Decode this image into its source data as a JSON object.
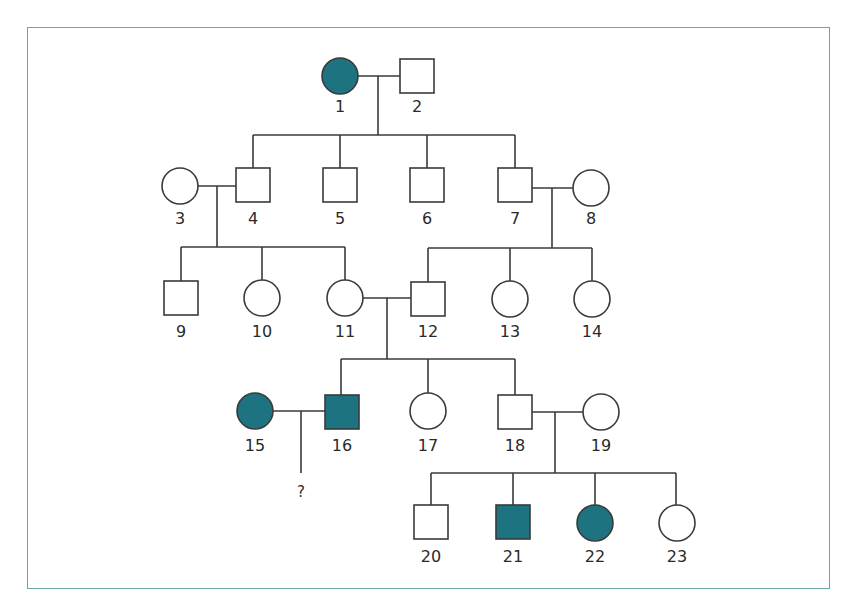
{
  "diagram": {
    "type": "pedigree",
    "colors": {
      "affected_fill": "#1d7380",
      "stroke": "#3a3a3a",
      "unaffected_fill": "#ffffff",
      "frame": "#6aa6ae"
    },
    "individuals": [
      {
        "id": "1",
        "label": "1",
        "sex": "female",
        "affected": true,
        "generation": 1
      },
      {
        "id": "2",
        "label": "2",
        "sex": "male",
        "affected": false,
        "generation": 1
      },
      {
        "id": "3",
        "label": "3",
        "sex": "female",
        "affected": false,
        "generation": 2
      },
      {
        "id": "4",
        "label": "4",
        "sex": "male",
        "affected": false,
        "generation": 2
      },
      {
        "id": "5",
        "label": "5",
        "sex": "male",
        "affected": false,
        "generation": 2
      },
      {
        "id": "6",
        "label": "6",
        "sex": "male",
        "affected": false,
        "generation": 2
      },
      {
        "id": "7",
        "label": "7",
        "sex": "male",
        "affected": false,
        "generation": 2
      },
      {
        "id": "8",
        "label": "8",
        "sex": "female",
        "affected": false,
        "generation": 2
      },
      {
        "id": "9",
        "label": "9",
        "sex": "male",
        "affected": false,
        "generation": 3
      },
      {
        "id": "10",
        "label": "10",
        "sex": "female",
        "affected": false,
        "generation": 3
      },
      {
        "id": "11",
        "label": "11",
        "sex": "female",
        "affected": false,
        "generation": 3
      },
      {
        "id": "12",
        "label": "12",
        "sex": "male",
        "affected": false,
        "generation": 3
      },
      {
        "id": "13",
        "label": "13",
        "sex": "female",
        "affected": false,
        "generation": 3
      },
      {
        "id": "14",
        "label": "14",
        "sex": "female",
        "affected": false,
        "generation": 3
      },
      {
        "id": "15",
        "label": "15",
        "sex": "female",
        "affected": true,
        "generation": 4
      },
      {
        "id": "16",
        "label": "16",
        "sex": "male",
        "affected": true,
        "generation": 4
      },
      {
        "id": "17",
        "label": "17",
        "sex": "female",
        "affected": false,
        "generation": 4
      },
      {
        "id": "18",
        "label": "18",
        "sex": "male",
        "affected": false,
        "generation": 4
      },
      {
        "id": "19",
        "label": "19",
        "sex": "female",
        "affected": false,
        "generation": 4
      },
      {
        "id": "20",
        "label": "20",
        "sex": "male",
        "affected": false,
        "generation": 5
      },
      {
        "id": "21",
        "label": "21",
        "sex": "male",
        "affected": true,
        "generation": 5
      },
      {
        "id": "22",
        "label": "22",
        "sex": "female",
        "affected": true,
        "generation": 5
      },
      {
        "id": "23",
        "label": "23",
        "sex": "female",
        "affected": false,
        "generation": 5
      }
    ],
    "unknown_offspring_label": "?",
    "matings": [
      {
        "parents": [
          "1",
          "2"
        ],
        "children": [
          "4",
          "5",
          "6",
          "7"
        ]
      },
      {
        "parents": [
          "3",
          "4"
        ],
        "children": [
          "9",
          "10",
          "11"
        ]
      },
      {
        "parents": [
          "7",
          "8"
        ],
        "children": [
          "12",
          "13",
          "14"
        ]
      },
      {
        "parents": [
          "11",
          "12"
        ],
        "children": [
          "16",
          "17",
          "18"
        ]
      },
      {
        "parents": [
          "15",
          "16"
        ],
        "children": [
          "?"
        ]
      },
      {
        "parents": [
          "18",
          "19"
        ],
        "children": [
          "20",
          "21",
          "22",
          "23"
        ]
      }
    ]
  }
}
